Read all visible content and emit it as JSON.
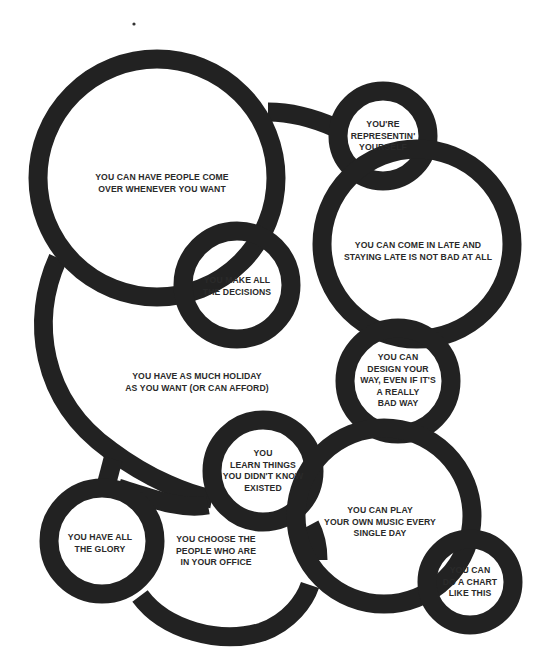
{
  "diagram": {
    "type": "bubble-network",
    "ink_color": "#222222",
    "background": "#ffffff",
    "nodes": [
      {
        "id": "people-come-over",
        "lines": [
          "YOU CAN HAVE PEOPLE COME",
          "OVER WHENEVER YOU WANT"
        ]
      },
      {
        "id": "representin",
        "lines": [
          "YOU'RE",
          "REPRESENTIN'",
          "YOURSELF"
        ]
      },
      {
        "id": "come-in-late",
        "lines": [
          "YOU CAN COME IN LATE AND",
          "STAYING LATE IS NOT BAD AT ALL"
        ]
      },
      {
        "id": "make-decisions",
        "lines": [
          "YOU MAKE ALL",
          "THE DECISIONS"
        ]
      },
      {
        "id": "holiday",
        "lines": [
          "YOU HAVE AS MUCH HOLIDAY",
          "AS YOU WANT (OR CAN AFFORD)"
        ]
      },
      {
        "id": "design-your-way",
        "lines": [
          "YOU CAN",
          "DESIGN YOUR",
          "WAY, EVEN IF IT'S",
          "A REALLY",
          "BAD WAY"
        ]
      },
      {
        "id": "learn-things",
        "lines": [
          "YOU",
          "LEARN THINGS",
          "YOU DIDN'T KNOW",
          "EXISTED"
        ]
      },
      {
        "id": "play-music",
        "lines": [
          "YOU CAN PLAY",
          "YOUR OWN MUSIC EVERY",
          "SINGLE DAY"
        ]
      },
      {
        "id": "all-the-glory",
        "lines": [
          "YOU HAVE ALL",
          "THE GLORY"
        ]
      },
      {
        "id": "choose-people",
        "lines": [
          "YOU CHOOSE THE",
          "PEOPLE WHO ARE",
          "IN YOUR OFFICE"
        ]
      },
      {
        "id": "do-a-chart",
        "lines": [
          "YOU CAN",
          "DO A CHART",
          "LIKE THIS"
        ]
      }
    ],
    "connections": [
      [
        "people-come-over",
        "representin"
      ],
      [
        "representin",
        "come-in-late"
      ],
      [
        "people-come-over",
        "make-decisions"
      ],
      [
        "make-decisions",
        "come-in-late"
      ],
      [
        "people-come-over",
        "holiday"
      ],
      [
        "holiday",
        "learn-things"
      ],
      [
        "come-in-late",
        "design-your-way"
      ],
      [
        "design-your-way",
        "play-music"
      ],
      [
        "learn-things",
        "play-music"
      ],
      [
        "holiday",
        "all-the-glory"
      ],
      [
        "all-the-glory",
        "learn-things"
      ],
      [
        "all-the-glory",
        "choose-people"
      ],
      [
        "choose-people",
        "play-music"
      ],
      [
        "play-music",
        "do-a-chart"
      ]
    ]
  }
}
